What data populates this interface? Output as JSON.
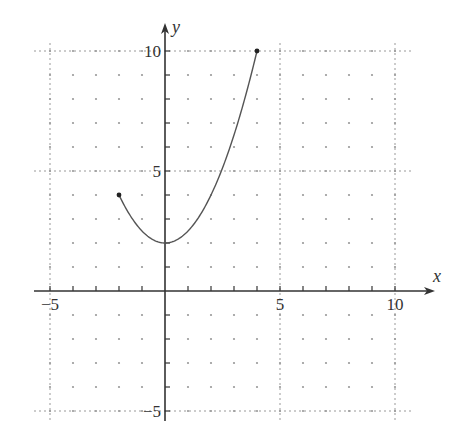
{
  "chart_data": {
    "type": "line",
    "title": "",
    "xlabel": "x",
    "ylabel": "y",
    "xlim": [
      -5,
      10
    ],
    "ylim": [
      -5,
      10
    ],
    "x_ticks": [
      -5,
      5,
      10
    ],
    "y_ticks": [
      -5,
      5,
      10
    ],
    "x_tick_labels": [
      "−5",
      "5",
      "10"
    ],
    "y_tick_labels": [
      "−5",
      "5",
      "10"
    ],
    "grid": "dotted, major lines every 5 units, dots every 1 unit",
    "legend": null,
    "series": [
      {
        "name": "y = x^2/2 + 2",
        "domain": [
          -2,
          4
        ],
        "x": [
          -2,
          -1,
          0,
          1,
          2,
          3,
          4
        ],
        "y": [
          4,
          2.5,
          2,
          2.5,
          4,
          6.5,
          10
        ],
        "endpoints": [
          [
            -2,
            4
          ],
          [
            4,
            10
          ]
        ],
        "endpoint_style": "closed-dot"
      }
    ]
  },
  "axes": {
    "x_label": "x",
    "y_label": "y"
  },
  "colors": {
    "curve": "#555555",
    "axis": "#333333",
    "grid": "#999999"
  }
}
